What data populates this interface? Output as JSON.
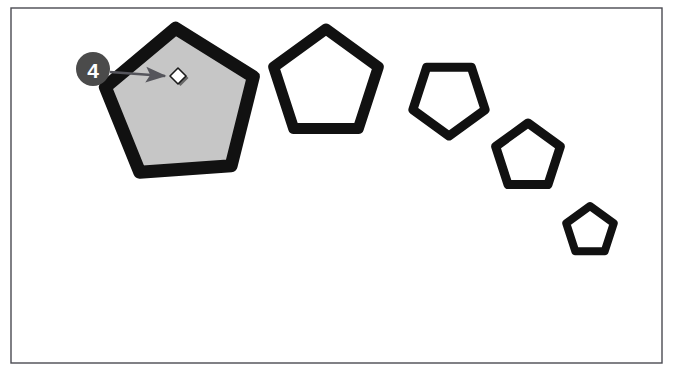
{
  "figure": {
    "canvas_background": "#ffffff",
    "frame": {
      "name": "canvas-frame",
      "x": 11,
      "y": 8,
      "width": 651,
      "height": 355,
      "stroke": "#4a4a52",
      "stroke_width": 1.4,
      "fill": "#ffffff"
    }
  },
  "callout": {
    "number": "4",
    "badge_fill": "#4b4b4b",
    "badge_text_color": "#ffffff",
    "badge_cx": 93,
    "badge_cy": 69,
    "badge_r": 17,
    "leader_color": "#55555c",
    "leader_width": 2.6,
    "leader_x1": 110,
    "leader_y1": 72,
    "leader_x2": 165,
    "leader_y2": 76
  },
  "anchor_handle": {
    "name": "anchor-point-handle",
    "cx": 178,
    "cy": 76,
    "size": 8,
    "fill": "#ffffff",
    "stroke": "#1a1a1a",
    "stroke_width": 1.6,
    "shadow": "#555555"
  },
  "shapes": {
    "stroke_color": "#111111",
    "items": [
      {
        "name": "pentagon-1-selected",
        "label": "Pentagon 1",
        "cx": 181,
        "cy": 106,
        "radius": 78,
        "rotation": -4,
        "stroke_width": 13,
        "fill": "#c6c6c6",
        "selected": true
      },
      {
        "name": "pentagon-2",
        "label": "Pentagon 2",
        "cx": 326,
        "cy": 84,
        "radius": 55,
        "rotation": 0,
        "stroke_width": 11,
        "fill": "#ffffff",
        "selected": false
      },
      {
        "name": "pentagon-3",
        "label": "Pentagon 3",
        "cx": 449,
        "cy": 98,
        "radius": 38,
        "rotation": 180,
        "stroke_width": 9,
        "fill": "#ffffff",
        "selected": false
      },
      {
        "name": "pentagon-4",
        "label": "Pentagon 4",
        "cx": 528,
        "cy": 157,
        "radius": 34,
        "rotation": -72,
        "stroke_width": 9,
        "fill": "#ffffff",
        "selected": false
      },
      {
        "name": "pentagon-5",
        "label": "Pentagon 5",
        "cx": 590,
        "cy": 231,
        "radius": 25,
        "rotation": 0,
        "stroke_width": 8,
        "fill": "#ffffff",
        "selected": false
      }
    ]
  }
}
